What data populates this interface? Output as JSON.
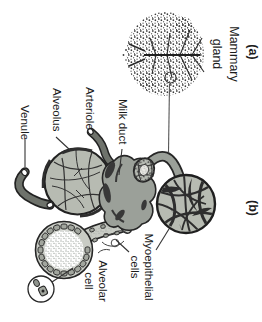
{
  "figure": {
    "panel_a": {
      "tag": "(a)",
      "label_line1": "Mammary",
      "label_line2": "gland"
    },
    "panel_b": {
      "tag": "(b)",
      "label_milk_duct": "Milk duct",
      "label_arteriole": "Arteriole",
      "label_alveolus": "Alveolus",
      "label_venule": "Venule",
      "label_myoepithelial_line1": "Myoepithelial",
      "label_myoepithelial_line2": "cells",
      "label_alveolar_cell_line1": "Alveolar",
      "label_alveolar_cell_line2": "cell"
    },
    "colors": {
      "background": "#ffffff",
      "ink": "#1f1f1f",
      "alveolus_fill": "#b7bbb2",
      "hub_fill": "#9ba099",
      "ring_fill": "#c9ccc5",
      "vessel_fill": "#6e726b",
      "cell_fill": "#a2a69e",
      "band": "#2e2e2e",
      "speckle": "#3d3d3d",
      "stipple": "#aeb4ae"
    }
  }
}
